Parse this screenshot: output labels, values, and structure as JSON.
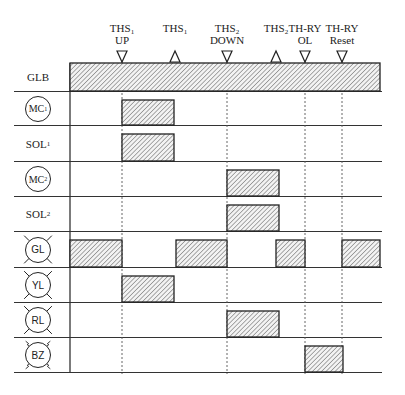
{
  "events": [
    {
      "id": "ths1-up",
      "line1": "THS",
      "sub": "1",
      "line2": "UP",
      "x": 122,
      "marker": "down"
    },
    {
      "id": "ths1",
      "line1": "THS",
      "sub": "1",
      "line2": "",
      "x": 175,
      "marker": "up"
    },
    {
      "id": "ths2-down",
      "line1": "THS",
      "sub": "2",
      "line2": "DOWN",
      "x": 227,
      "marker": "down"
    },
    {
      "id": "ths2",
      "line1": "THS",
      "sub": "2",
      "line2": "",
      "x": 276,
      "marker": "up"
    },
    {
      "id": "th-ry-ol",
      "line1": "TH-RY",
      "sub": "",
      "line2": "OL",
      "x": 305,
      "marker": "down"
    },
    {
      "id": "th-ry-reset",
      "line1": "TH-RY",
      "sub": "",
      "line2": "Reset",
      "x": 342,
      "marker": "down"
    }
  ],
  "rows": [
    {
      "id": "glb",
      "label": "GLB",
      "sub": "",
      "symbol": "none",
      "top": 63,
      "bottom": 91,
      "bars": [
        [
          70,
          380
        ]
      ]
    },
    {
      "id": "mc1",
      "label": "MC",
      "sub": "1",
      "symbol": "coil",
      "top": 92,
      "bottom": 125,
      "bars": [
        [
          122,
          174
        ]
      ]
    },
    {
      "id": "sol1",
      "label": "SOL",
      "sub": "1",
      "symbol": "none",
      "top": 126,
      "bottom": 161,
      "bars": [
        [
          122,
          174
        ]
      ]
    },
    {
      "id": "mc2",
      "label": "MC",
      "sub": "2",
      "symbol": "coil",
      "top": 162,
      "bottom": 196,
      "bars": [
        [
          227,
          279
        ]
      ]
    },
    {
      "id": "sol2",
      "label": "SOL",
      "sub": "2",
      "symbol": "none",
      "top": 197,
      "bottom": 231,
      "bars": [
        [
          227,
          279
        ]
      ]
    },
    {
      "id": "gl",
      "label": "GL",
      "sub": "",
      "symbol": "lamp",
      "top": 232,
      "bottom": 267,
      "bars": [
        [
          70,
          122
        ],
        [
          176,
          227
        ],
        [
          276,
          305
        ],
        [
          342,
          380
        ]
      ]
    },
    {
      "id": "yl",
      "label": "YL",
      "sub": "",
      "symbol": "lamp",
      "top": 268,
      "bottom": 302,
      "bars": [
        [
          122,
          174
        ]
      ]
    },
    {
      "id": "rl",
      "label": "RL",
      "sub": "",
      "symbol": "lamp",
      "top": 303,
      "bottom": 337,
      "bars": [
        [
          227,
          279
        ]
      ]
    },
    {
      "id": "bz",
      "label": "BZ",
      "sub": "",
      "symbol": "buzzer",
      "top": 338,
      "bottom": 372,
      "bars": [
        [
          305,
          343
        ]
      ]
    }
  ],
  "grid": {
    "label_col_left": 14,
    "timeline_left": 70,
    "timeline_right": 382,
    "dashed_x": [
      122,
      227,
      305,
      342
    ],
    "line_color": "#333333",
    "hatch_color": "#555555",
    "fill_color": "#f2f2f2"
  }
}
